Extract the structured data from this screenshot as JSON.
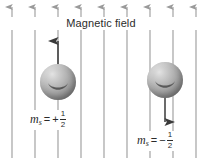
{
  "figure": {
    "title": "Magnetic field",
    "width": 202,
    "height": 162,
    "background": "#ffffff",
    "line_color": "#9a9a9a",
    "arrow_color": "#3a3a3a",
    "text_color": "#2b2b2b",
    "sphere_color": "#a0a0a0"
  },
  "field_lines": {
    "count": 10,
    "direction": "up",
    "x_positions": [
      12,
      35,
      58,
      81,
      104,
      127,
      150,
      173,
      196,
      219
    ],
    "top": 6,
    "bottom": 158
  },
  "particles": [
    {
      "id": "spin-up",
      "spin_direction": "up",
      "label": {
        "symbol": "m",
        "subscript": "s",
        "equals": "=",
        "sign": "+",
        "numerator": "1",
        "denominator": "2",
        "text": "ms = + 1/2"
      }
    },
    {
      "id": "spin-down",
      "spin_direction": "down",
      "label": {
        "symbol": "m",
        "subscript": "s",
        "equals": "=",
        "sign": "−",
        "numerator": "1",
        "denominator": "2",
        "text": "ms = − 1/2"
      }
    }
  ],
  "icons": {
    "field_arrow": "arrow-up-icon",
    "spin_up_arrow": "arrow-up-icon",
    "spin_down_arrow": "arrow-down-icon",
    "sphere": "sphere-icon"
  }
}
